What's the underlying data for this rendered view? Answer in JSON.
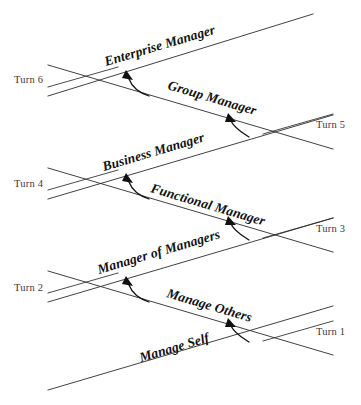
{
  "diagram": {
    "type": "zigzag-pipeline",
    "colors": {
      "line": "#2b2b2b",
      "arrow": "#111111",
      "stage_text": "#111111",
      "turn_text": "#3a3a3a",
      "background": "#ffffff"
    },
    "turns": [
      {
        "id": "turn-1",
        "label": "Turn 1",
        "side": "right",
        "x": 316,
        "y": 331
      },
      {
        "id": "turn-2",
        "label": "Turn 2",
        "side": "left",
        "x": 14,
        "y": 287
      },
      {
        "id": "turn-3",
        "label": "Turn 3",
        "side": "right",
        "x": 316,
        "y": 228
      },
      {
        "id": "turn-4",
        "label": "Turn 4",
        "side": "left",
        "x": 14,
        "y": 183
      },
      {
        "id": "turn-5",
        "label": "Turn 5",
        "side": "right",
        "x": 316,
        "y": 124
      },
      {
        "id": "turn-6",
        "label": "Turn 6",
        "side": "left",
        "x": 14,
        "y": 79
      }
    ],
    "stages": [
      {
        "id": "stage-manage-self",
        "label": "Manage Self",
        "direction": "ascending",
        "x": 141,
        "y": 362,
        "rotate": -16.5
      },
      {
        "id": "stage-manage-others",
        "label": "Manage Others",
        "direction": "descending",
        "x": 166,
        "y": 297,
        "rotate": 16.5
      },
      {
        "id": "stage-manager-of-managers",
        "label": "Manager of Managers",
        "direction": "ascending",
        "x": 99,
        "y": 274,
        "rotate": -16.5
      },
      {
        "id": "stage-functional-manager",
        "label": "Functional Manager",
        "direction": "descending",
        "x": 150,
        "y": 192,
        "rotate": 16.5
      },
      {
        "id": "stage-business-manager",
        "label": "Business Manager",
        "direction": "ascending",
        "x": 104,
        "y": 171,
        "rotate": -16.5
      },
      {
        "id": "stage-group-manager",
        "label": "Group Manager",
        "direction": "descending",
        "x": 167,
        "y": 89,
        "rotate": 16.5
      },
      {
        "id": "stage-enterprise-manager",
        "label": "Enterprise Manager",
        "direction": "ascending",
        "x": 106,
        "y": 66,
        "rotate": -16.5
      }
    ],
    "transitions": [
      {
        "id": "arrow-self-to-others",
        "from": "Manage Self",
        "to": "Manage Others",
        "points": "245,340 236,331 230,322"
      },
      {
        "id": "arrow-others-to-manager-of-managers",
        "from": "Manage Others",
        "to": "Manager of Managers",
        "points": "147,300 135,292 128,281"
      },
      {
        "id": "arrow-manager-of-managers-to-functional",
        "from": "Manager of Managers",
        "to": "Functional Manager",
        "points": "245,238 236,229 230,220"
      },
      {
        "id": "arrow-functional-to-business",
        "from": "Functional Manager",
        "to": "Business Manager",
        "points": "147,198 135,190 128,179"
      },
      {
        "id": "arrow-business-to-group",
        "from": "Business Manager",
        "to": "Group Manager",
        "points": "245,135 236,126 230,117"
      },
      {
        "id": "arrow-group-to-enterprise",
        "from": "Group Manager",
        "to": "Enterprise Manager",
        "points": "147,94 135,86 128,75"
      }
    ]
  }
}
